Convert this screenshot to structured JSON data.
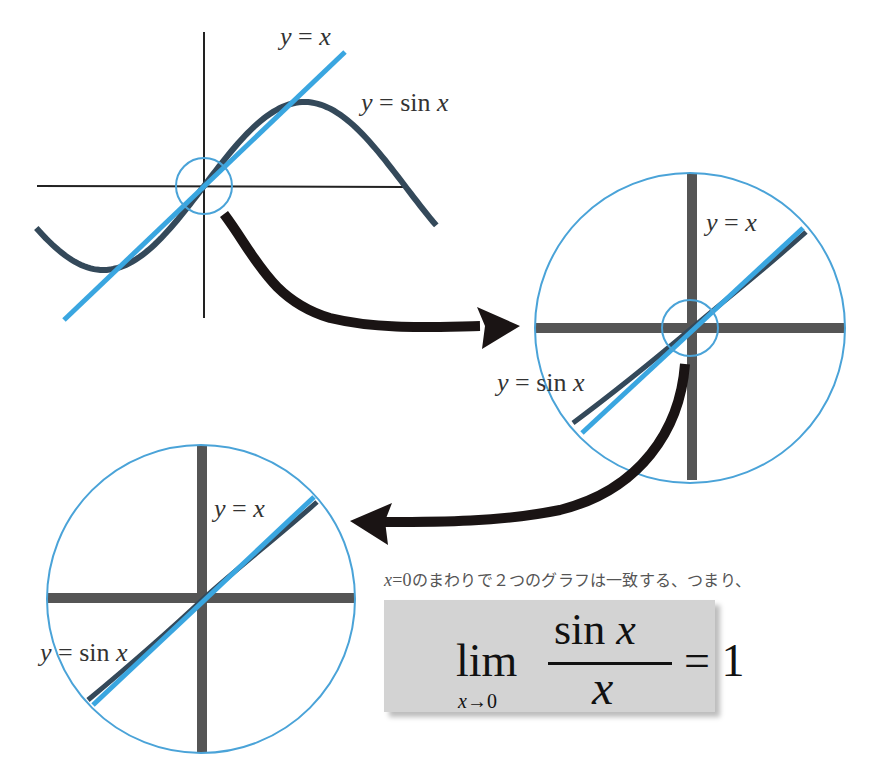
{
  "colors": {
    "line_y_eq_x": "#3aa6e0",
    "curve_sin": "#34495a",
    "axis_thin": "#222222",
    "axis_thick": "#555555",
    "zoom_circle": "#4aa3d8",
    "arrow": "#1a1414",
    "formula_bg": "#d3d3d3"
  },
  "panels": {
    "overview": {
      "label_line": "y = x",
      "label_line_var1": "y",
      "label_line_eq": " = ",
      "label_line_var2": "x",
      "label_sin_var": "y",
      "label_sin_eq": " = sin ",
      "label_sin_x": "x"
    },
    "zoom1": {
      "label_line_var1": "y",
      "label_line_eq": " = ",
      "label_line_var2": "x",
      "label_sin_var": "y",
      "label_sin_eq": " = sin ",
      "label_sin_x": "x"
    },
    "zoom2": {
      "label_line_var1": "y",
      "label_line_eq": " = ",
      "label_line_var2": "x",
      "label_sin_var": "y",
      "label_sin_eq": " = sin ",
      "label_sin_x": "x"
    }
  },
  "caption": {
    "var": "x",
    "eq": "=",
    "zero": "0",
    "text": "のまわりで２つのグラフは一致する、つまり、"
  },
  "formula": {
    "lim": "lim",
    "sub_var": "x",
    "sub_arrow": "→0",
    "num_fn": "sin ",
    "num_var": "x",
    "den_var": "x",
    "rhs": "= 1"
  }
}
